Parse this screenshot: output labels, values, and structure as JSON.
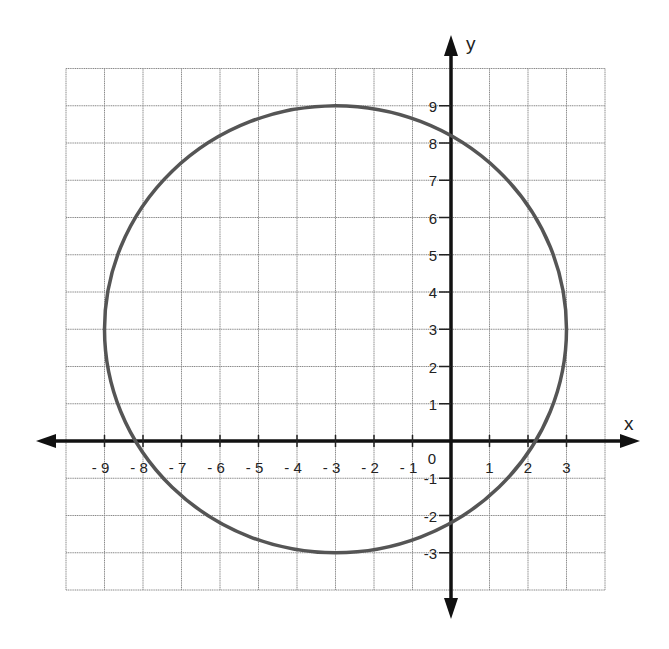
{
  "chart_data": {
    "type": "line",
    "title": "",
    "xlabel": "x",
    "ylabel": "y",
    "xlim": [
      -10,
      4
    ],
    "ylim": [
      -4,
      10
    ],
    "grid": true,
    "x_tick_labels": [
      "- 9",
      "- 8",
      "- 7",
      "- 6",
      "- 5",
      "- 4",
      "- 3",
      "- 2",
      "- 1",
      "0",
      "1",
      "2",
      "3"
    ],
    "x_ticks": [
      -9,
      -8,
      -7,
      -6,
      -5,
      -4,
      -3,
      -2,
      -1,
      0,
      1,
      2,
      3
    ],
    "y_tick_labels": [
      "9",
      "8",
      "7",
      "6",
      "5",
      "4",
      "3",
      "2",
      "1",
      "-1",
      "-2",
      "-3"
    ],
    "y_ticks": [
      9,
      8,
      7,
      6,
      5,
      4,
      3,
      2,
      1,
      -1,
      -2,
      -3
    ],
    "series": [
      {
        "name": "circle",
        "shape": "circle",
        "center": [
          -3,
          3
        ],
        "radius": 6,
        "equation": "(x+3)^2 + (y-3)^2 = 36",
        "color": "#555555"
      }
    ],
    "key_points": {
      "top": [
        -3,
        9
      ],
      "bottom": [
        -3,
        -3
      ],
      "left": [
        -9,
        3
      ],
      "right": [
        3,
        3
      ],
      "x_intercepts": [
        -8.2,
        2.2
      ],
      "y_intercepts": [
        -2.2,
        8.2
      ]
    }
  },
  "labels": {
    "x_axis": "x",
    "y_axis": "y",
    "origin": "0"
  },
  "colors": {
    "curve": "#555555",
    "axis": "#111111",
    "grid": "#8a8a8a"
  }
}
